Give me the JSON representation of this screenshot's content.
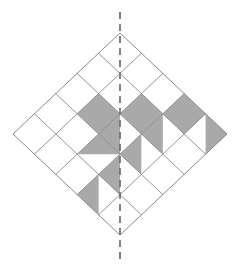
{
  "figure": {
    "title": "Shaded diamond grid with vertical line of symmetry",
    "description": "A square rotated 45 degrees subdivided into a 5 by 5 grid of smaller diamonds, with several full cells and triangular half-cells shaded gray, and a vertical dashed mirror line through the center."
  },
  "canvas": {
    "width": 242,
    "height": 272,
    "background": "#ffffff"
  },
  "colors": {
    "shade_fill": "#a9a9a9",
    "grid_stroke": "#8a8a8a",
    "outline_stroke": "#8a8a8a",
    "dash_stroke": "#6e6e6e",
    "empty_fill": "#ffffff"
  },
  "geometry": {
    "top_vertex": {
      "x": 120,
      "y": 33
    },
    "left_vertex": {
      "x": 13,
      "y": 133
    },
    "right_vertex": {
      "x": 227,
      "y": 133
    },
    "bottom_vertex": {
      "x": 120,
      "y": 235
    },
    "grid_divisions": 5,
    "half_width": 107,
    "half_height": 101,
    "cell_step_x": 21.4,
    "cell_step_y": 20.2,
    "grid_stroke_width": 0.9,
    "outline_stroke_width": 1.0
  },
  "symmetry_line": {
    "label": "vertical line of symmetry",
    "x": 120,
    "y_start": 12,
    "y_end": 260,
    "stroke_width": 1.7,
    "dash_pattern": "7 5",
    "color": "#6e6e6e"
  },
  "grid_cells": [
    {
      "u": 0,
      "v": 0,
      "fill": "none"
    },
    {
      "u": 0,
      "v": 1,
      "fill": "none"
    },
    {
      "u": 0,
      "v": 2,
      "fill": "none"
    },
    {
      "u": 0,
      "v": 3,
      "fill": "none"
    },
    {
      "u": 0,
      "v": 4,
      "fill": "none"
    },
    {
      "u": 1,
      "v": 0,
      "fill": "none"
    },
    {
      "u": 1,
      "v": 1,
      "fill": "none"
    },
    {
      "u": 1,
      "v": 2,
      "fill": "full"
    },
    {
      "u": 1,
      "v": 3,
      "fill": "none"
    },
    {
      "u": 1,
      "v": 4,
      "fill": "none"
    },
    {
      "u": 2,
      "v": 0,
      "fill": "none"
    },
    {
      "u": 2,
      "v": 1,
      "fill": "full"
    },
    {
      "u": 2,
      "v": 2,
      "fill": "left"
    },
    {
      "u": 2,
      "v": 3,
      "fill": "top"
    },
    {
      "u": 2,
      "v": 4,
      "fill": "none"
    },
    {
      "u": 3,
      "v": 0,
      "fill": "full"
    },
    {
      "u": 3,
      "v": 1,
      "fill": "left"
    },
    {
      "u": 3,
      "v": 2,
      "fill": "left"
    },
    {
      "u": 3,
      "v": 3,
      "fill": "left"
    },
    {
      "u": 3,
      "v": 4,
      "fill": "left"
    },
    {
      "u": 4,
      "v": 0,
      "fill": "right"
    },
    {
      "u": 4,
      "v": 1,
      "fill": "none"
    },
    {
      "u": 4,
      "v": 2,
      "fill": "none"
    },
    {
      "u": 4,
      "v": 3,
      "fill": "none"
    },
    {
      "u": 4,
      "v": 4,
      "fill": "none"
    }
  ],
  "shaded_summary": {
    "full_cells": 3,
    "half_cells": 7,
    "total_shaded_area_cells": 6.5
  }
}
